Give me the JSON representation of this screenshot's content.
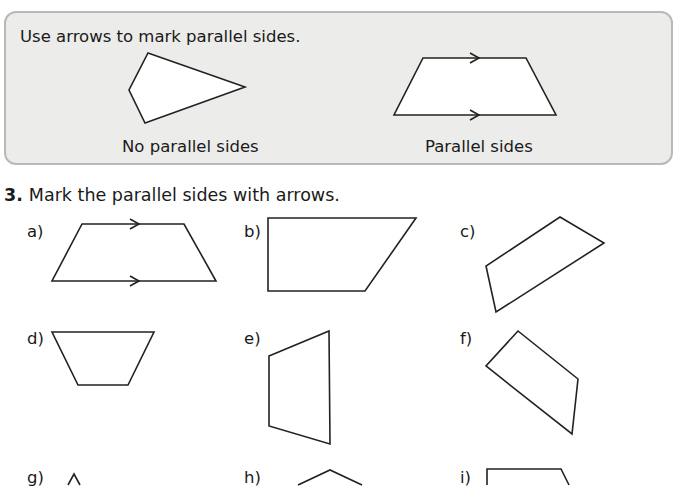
{
  "info_box": {
    "title": "Use arrows to mark parallel sides.",
    "examples": [
      {
        "caption": "No parallel sides",
        "shape": "kite-like quadrilateral",
        "arrows": false
      },
      {
        "caption": "Parallel sides",
        "shape": "trapezium",
        "arrows": true
      }
    ]
  },
  "question": {
    "number": "3.",
    "text": "Mark the parallel sides with arrows.",
    "items": [
      {
        "label": "a)",
        "shape": "trapezium",
        "arrows_marked": true
      },
      {
        "label": "b)",
        "shape": "right trapezium",
        "arrows_marked": false
      },
      {
        "label": "c)",
        "shape": "quadrilateral",
        "arrows_marked": false
      },
      {
        "label": "d)",
        "shape": "inverted trapezium",
        "arrows_marked": false
      },
      {
        "label": "e)",
        "shape": "vertical trapezium",
        "arrows_marked": false
      },
      {
        "label": "f)",
        "shape": "rotated quadrilateral",
        "arrows_marked": false
      },
      {
        "label": "g)",
        "shape": "triangle (partially visible)",
        "arrows_marked": false
      },
      {
        "label": "h)",
        "shape": "shape (partially visible)",
        "arrows_marked": false
      },
      {
        "label": "i)",
        "shape": "trapezium (partially visible)",
        "arrows_marked": false
      }
    ]
  },
  "colors": {
    "info_box_bg": "#ececea",
    "info_box_border": "#b9b9b7",
    "stroke": "#222222",
    "text": "#1a1a1a"
  }
}
